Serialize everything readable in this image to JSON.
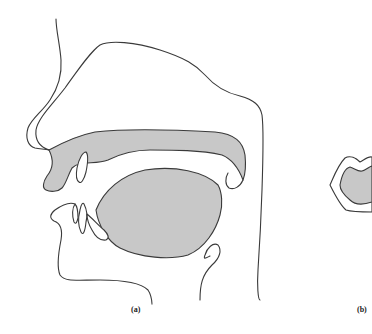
{
  "figure": {
    "panels": [
      {
        "id": "a",
        "label": "(a)",
        "description": "Sagittal cross-section of the human vocal tract showing nasal cavity, palate, tongue, teeth, lips and pharynx"
      },
      {
        "id": "b",
        "label": "(b)",
        "description": "Frontal view of lips (partially cropped)"
      }
    ],
    "colors": {
      "fill": "#c8c8c8",
      "stroke": "#3a3a3a",
      "background": "#ffffff"
    }
  }
}
